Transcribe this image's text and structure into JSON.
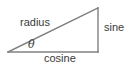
{
  "diagram": {
    "name": "right-triangle-trigonometry",
    "background_color": "#ffffff",
    "stroke_color": "#808080",
    "text_color": "#3a3a3a",
    "labels": {
      "hypotenuse": "radius",
      "opposite": "sine",
      "adjacent": "cosine",
      "angle": "θ"
    },
    "geometry": {
      "left_vertex": [
        8,
        52
      ],
      "right_angle_vertex": [
        98,
        52
      ],
      "apex_vertex": [
        98,
        8
      ],
      "stroke_width": 1.4
    }
  }
}
